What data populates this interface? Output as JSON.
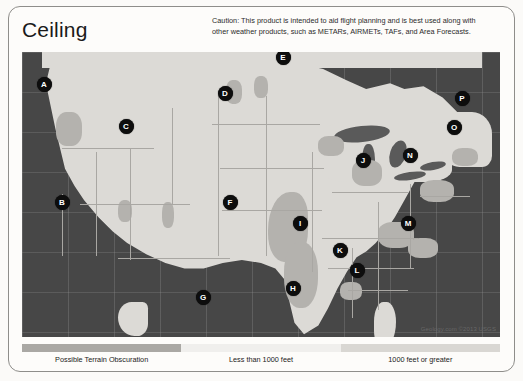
{
  "page": {
    "title": "Ceiling",
    "caution": "Caution: This product is intended to aid flight planning and is best used along with other weather products, such as METARs, AIRMETs, TAFs, and Area Forecasts."
  },
  "map": {
    "credit": "Geology.com ©2013 USGS",
    "colors": {
      "ocean": "#474747",
      "land": "#dcdad6",
      "terrain": "#b4b2ae",
      "marker": "#0d0d0d",
      "marker_text": "#ffffff"
    },
    "markers": [
      {
        "label": "A",
        "x": 44,
        "y": 84
      },
      {
        "label": "B",
        "x": 62,
        "y": 202
      },
      {
        "label": "C",
        "x": 126,
        "y": 126
      },
      {
        "label": "D",
        "x": 225,
        "y": 93
      },
      {
        "label": "E",
        "x": 283,
        "y": 57
      },
      {
        "label": "F",
        "x": 230,
        "y": 202
      },
      {
        "label": "G",
        "x": 203,
        "y": 297
      },
      {
        "label": "H",
        "x": 293,
        "y": 288
      },
      {
        "label": "I",
        "x": 300,
        "y": 223
      },
      {
        "label": "J",
        "x": 363,
        "y": 160
      },
      {
        "label": "K",
        "x": 340,
        "y": 250
      },
      {
        "label": "L",
        "x": 357,
        "y": 270
      },
      {
        "label": "M",
        "x": 408,
        "y": 223
      },
      {
        "label": "N",
        "x": 410,
        "y": 155
      },
      {
        "label": "O",
        "x": 454,
        "y": 127
      },
      {
        "label": "P",
        "x": 462,
        "y": 98
      }
    ]
  },
  "legend": {
    "items": [
      {
        "label": "Possible Terrain Obscuration",
        "color": "#aaa8a4"
      },
      {
        "label": "Less than 1000 feet",
        "color": "#f0efed"
      },
      {
        "label": "1000 feet or greater",
        "color": "#d9d7d3"
      }
    ]
  }
}
